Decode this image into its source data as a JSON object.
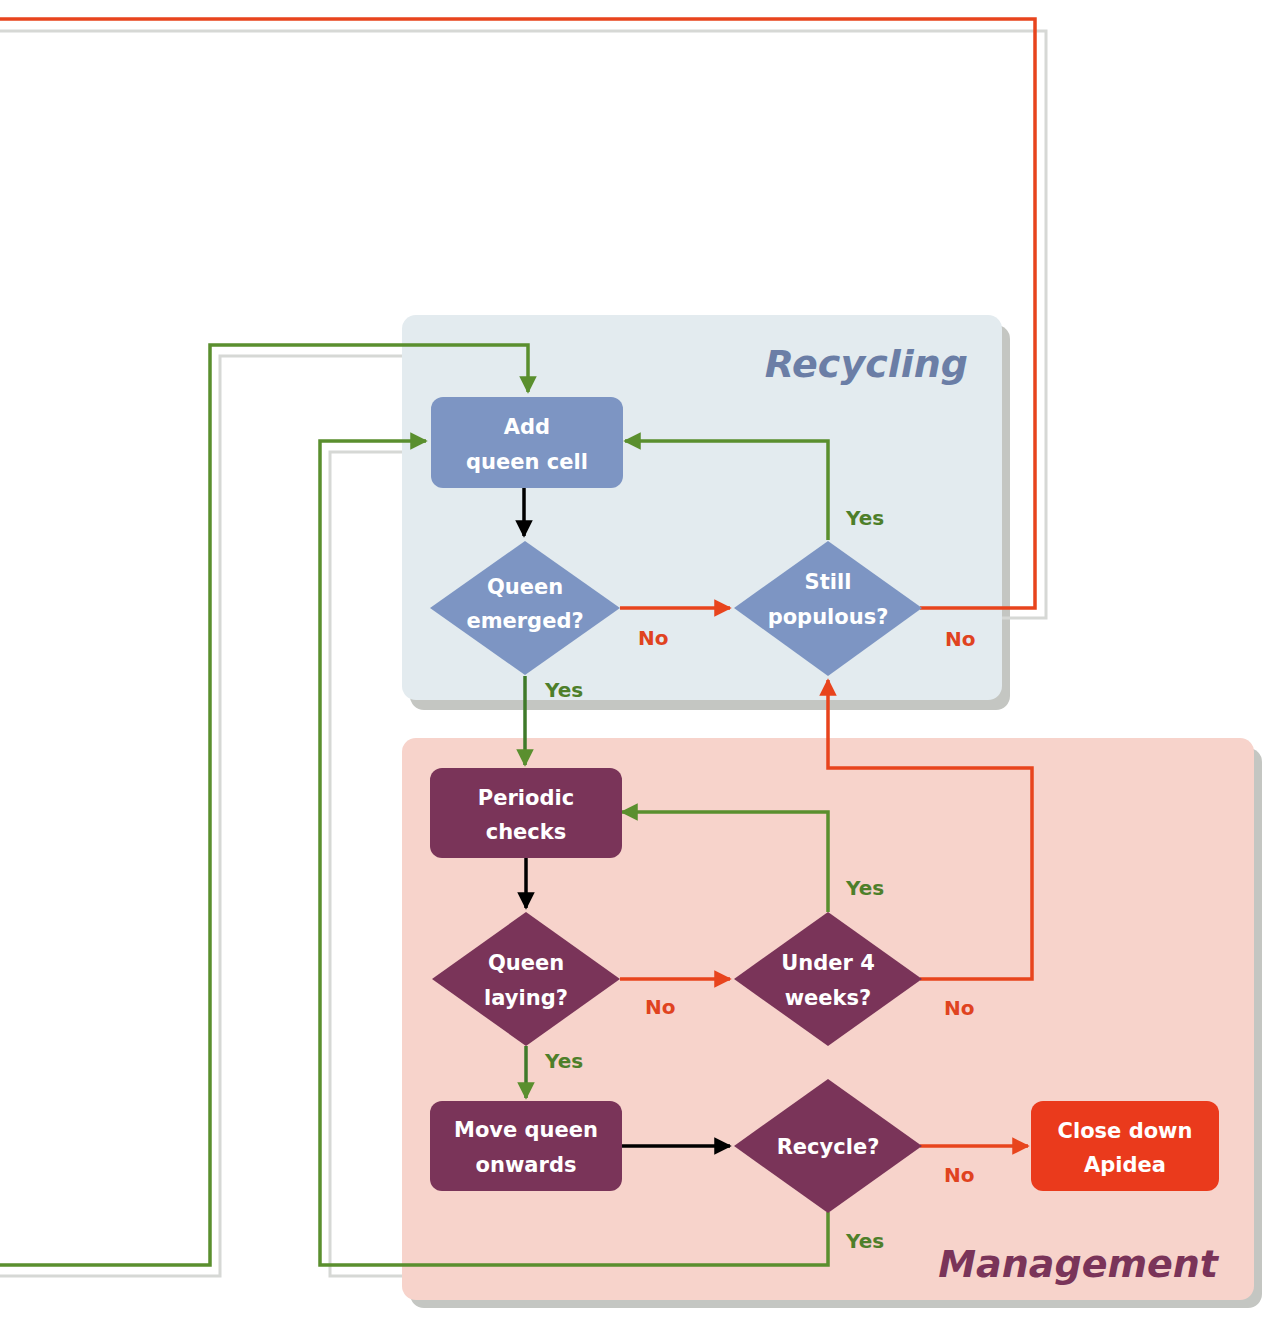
{
  "colors": {
    "recycling_panel": "#e3ebef",
    "management_panel": "#f7d3cb",
    "recycling_node": "#7d95c3",
    "management_node": "#7a3459",
    "terminal_node": "#ea3a1c",
    "yes_line": "#5a8f2e",
    "no_line": "#e8441d",
    "flow_line": "#000000",
    "recycling_title": "#6b7ea6",
    "management_title": "#7a3459"
  },
  "panels": {
    "recycling": {
      "title": "Recycling"
    },
    "management": {
      "title": "Management"
    }
  },
  "nodes": {
    "add_queen_cell": {
      "line1": "Add",
      "line2": "queen cell"
    },
    "queen_emerged": {
      "line1": "Queen",
      "line2": "emerged?"
    },
    "still_populous": {
      "line1": "Still",
      "line2": "populous?"
    },
    "periodic_checks": {
      "line1": "Periodic",
      "line2": "checks"
    },
    "queen_laying": {
      "line1": "Queen",
      "line2": "laying?"
    },
    "under_4_weeks": {
      "line1": "Under 4",
      "line2": "weeks?"
    },
    "move_queen_onwards": {
      "line1": "Move queen",
      "line2": "onwards"
    },
    "recycle": {
      "line1": "Recycle?"
    },
    "close_down_apidea": {
      "line1": "Close down",
      "line2": "Apidea"
    }
  },
  "edge_labels": {
    "queen_emerged_no": "No",
    "queen_emerged_yes": "Yes",
    "still_populous_yes": "Yes",
    "still_populous_no": "No",
    "queen_laying_no": "No",
    "queen_laying_yes": "Yes",
    "under_4_weeks_yes": "Yes",
    "under_4_weeks_no": "No",
    "recycle_no": "No",
    "recycle_yes": "Yes"
  }
}
